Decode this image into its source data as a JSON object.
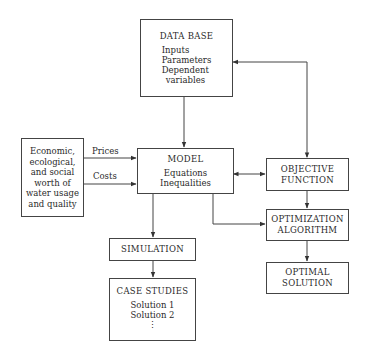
{
  "diagram": {
    "nodes": {
      "database": {
        "title": "DATA BASE",
        "items": [
          "Inputs",
          "Parameters",
          "Dependent",
          "variables"
        ]
      },
      "worth": {
        "lines": [
          "Economic,",
          "ecological,",
          "and social",
          "worth of",
          "water usage",
          "and quality"
        ]
      },
      "model": {
        "title": "MODEL",
        "items": [
          "Equations",
          "Inequalities"
        ]
      },
      "objective": {
        "lines": [
          "OBJECTIVE",
          "FUNCTION"
        ]
      },
      "optimization": {
        "lines": [
          "OPTIMIZATION",
          "ALGORITHM"
        ]
      },
      "optimal": {
        "lines": [
          "OPTIMAL",
          "SOLUTION"
        ]
      },
      "simulation": {
        "title": "SIMULATION"
      },
      "case_studies": {
        "title": "CASE STUDIES",
        "items": [
          "Solution 1",
          "Solution 2",
          "⋮"
        ]
      }
    },
    "edge_labels": {
      "prices": "Prices",
      "costs": "Costs"
    },
    "edges": [
      {
        "from": "database",
        "to": "model"
      },
      {
        "from": "worth",
        "to": "model",
        "label": "Prices"
      },
      {
        "from": "worth",
        "to": "model",
        "label": "Costs"
      },
      {
        "from": "model",
        "to": "objective",
        "bidirectional": true
      },
      {
        "from": "objective",
        "to": "database",
        "bidirectional": true
      },
      {
        "from": "objective",
        "to": "optimization"
      },
      {
        "from": "model",
        "to": "optimization"
      },
      {
        "from": "optimization",
        "to": "optimal"
      },
      {
        "from": "model",
        "to": "simulation"
      },
      {
        "from": "simulation",
        "to": "case_studies"
      }
    ]
  }
}
